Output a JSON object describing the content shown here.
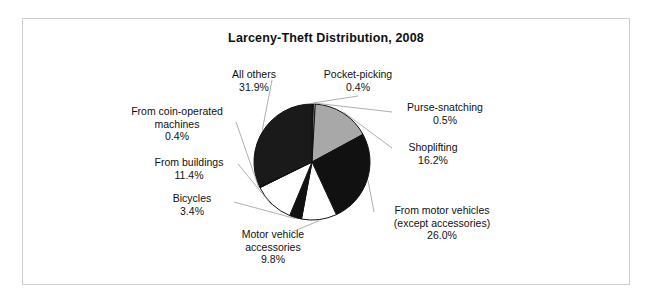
{
  "frame": {
    "border_color": "#cfcfcf"
  },
  "chart_data": {
    "type": "pie",
    "title": "Larceny-Theft Distribution, 2008",
    "xlabel": "",
    "ylabel": "",
    "legend_position": "none",
    "grid": false,
    "start_angle_deg": 0,
    "direction": "clockwise",
    "categories": [
      "Pocket-picking",
      "Purse-snatching",
      "Shoplifting",
      "From motor vehicles (except accessories)",
      "Motor vehicle accessories",
      "Bicycles",
      "From buildings",
      "From coin-operated machines",
      "All others"
    ],
    "values": [
      0.4,
      0.5,
      16.2,
      26.0,
      9.8,
      3.4,
      11.4,
      0.4,
      31.9
    ],
    "value_labels": [
      "0.4%",
      "0.5%",
      "16.2%",
      "26.0%",
      "9.8%",
      "3.4%",
      "11.4%",
      "0.4%",
      "31.9%"
    ],
    "colors": [
      "#111111",
      "#ffffff",
      "#a8a8a8",
      "#111111",
      "#ffffff",
      "#111111",
      "#ffffff",
      "#111111",
      "#1a1a1a"
    ],
    "units": "percent",
    "slice_edge_color": "#111111"
  },
  "labels": [
    {
      "name": "all-others",
      "lines": [
        "All others",
        "31.9%"
      ],
      "category": "All others",
      "value_label": "31.9%"
    },
    {
      "name": "pocket-picking",
      "lines": [
        "Pocket-picking",
        "0.4%"
      ],
      "category": "Pocket-picking",
      "value_label": "0.4%"
    },
    {
      "name": "purse-snatching",
      "lines": [
        "Purse-snatching",
        "0.5%"
      ],
      "category": "Purse-snatching",
      "value_label": "0.5%"
    },
    {
      "name": "shoplifting",
      "lines": [
        "Shoplifting",
        "16.2%"
      ],
      "category": "Shoplifting",
      "value_label": "16.2%"
    },
    {
      "name": "from-motor-vehicles",
      "lines": [
        "From motor vehicles",
        "(except accessories)",
        "26.0%"
      ],
      "category": "From motor vehicles (except accessories)",
      "value_label": "26.0%"
    },
    {
      "name": "motor-vehicle-accessories",
      "lines": [
        "Motor vehicle",
        "accessories",
        "9.8%"
      ],
      "category": "Motor vehicle accessories",
      "value_label": "9.8%"
    },
    {
      "name": "bicycles",
      "lines": [
        "Bicycles",
        "3.4%"
      ],
      "category": "Bicycles",
      "value_label": "3.4%"
    },
    {
      "name": "from-buildings",
      "lines": [
        "From buildings",
        "11.4%"
      ],
      "category": "From buildings",
      "value_label": "11.4%"
    },
    {
      "name": "from-coin-operated-machines",
      "lines": [
        "From coin-operated",
        "machines",
        "0.4%"
      ],
      "category": "From coin-operated machines",
      "value_label": "0.4%"
    }
  ]
}
